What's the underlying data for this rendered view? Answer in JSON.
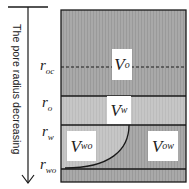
{
  "diagram": {
    "axis_label": "The pore radius decreasing",
    "colors": {
      "dark_region": "#a6a6a6",
      "light_region": "#c4c4c4",
      "lines": "#1a1a1a",
      "label_bg": "#ffffff"
    },
    "radius_levels": [
      {
        "symbol": "r",
        "subscript": "oc",
        "style": "dashed"
      },
      {
        "symbol": "r",
        "subscript": "o",
        "style": "solid"
      },
      {
        "symbol": "r",
        "subscript": "w",
        "style": "solid"
      },
      {
        "symbol": "r",
        "subscript": "wo",
        "style": "solid"
      }
    ],
    "regions": [
      {
        "symbol": "V",
        "subscript": "o"
      },
      {
        "symbol": "V",
        "subscript": "w"
      },
      {
        "symbol": "V",
        "subscript": "wo"
      },
      {
        "symbol": "V",
        "subscript": "ow"
      }
    ]
  }
}
